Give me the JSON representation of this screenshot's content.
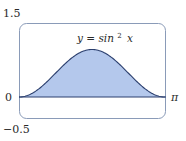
{
  "chart_data": {
    "type": "area",
    "title": "",
    "annotation": "y = sin² x",
    "function": "sin^2(x)",
    "xlabel": "",
    "ylabel": "",
    "x_tick_labels": [
      "π"
    ],
    "y_tick_labels": [
      "1.5",
      "0",
      "-0.5"
    ],
    "xlim": [
      0,
      3.14159
    ],
    "ylim": [
      -0.5,
      1.5
    ],
    "grid": false,
    "legend": null,
    "x": [
      0,
      0.3927,
      0.7854,
      1.1781,
      1.5708,
      1.9635,
      2.3562,
      2.7489,
      3.14159
    ],
    "values": [
      0,
      0.1464,
      0.5,
      0.8536,
      1.0,
      0.8536,
      0.5,
      0.1464,
      0
    ],
    "colors": {
      "fill": "#b4c8ec",
      "curve": "#2b3f6e",
      "frame": "#8a9bb8",
      "axis": "#2b3f6e"
    }
  },
  "labels": {
    "y_top": "1.5",
    "y_zero": "0",
    "y_bottom": "−0.5",
    "x_end": "π",
    "eq_lhs": "y = sin",
    "eq_sup": "2",
    "eq_var": "x"
  }
}
